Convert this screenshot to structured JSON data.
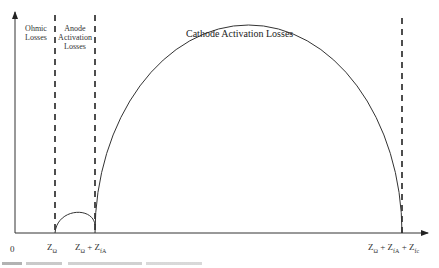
{
  "diagram": {
    "regions": [
      {
        "id": "ohmic",
        "label_line1": "Ohmic",
        "label_line2": "Losses"
      },
      {
        "id": "anode",
        "label_line1": "Anode",
        "label_line2": "Activation",
        "label_line3": "Losses"
      },
      {
        "id": "cathode",
        "label": "Cathode Activation Losses"
      }
    ],
    "x_ticks": {
      "origin": "0",
      "z1_main": "Z",
      "z1_sub": "Ω",
      "z2_main1": "Z",
      "z2_sub1": "Ω",
      "z2_plus": " + ",
      "z2_main2": "Z",
      "z2_sub2": "fA",
      "z3_main1": "Z",
      "z3_sub1": "Ω",
      "z3_plus1": " + ",
      "z3_main2": "Z",
      "z3_sub2": "fA",
      "z3_plus2": " + ",
      "z3_main3": "Z",
      "z3_sub3": "fc"
    },
    "colors": {
      "line": "#333333",
      "background": "#ffffff"
    }
  }
}
